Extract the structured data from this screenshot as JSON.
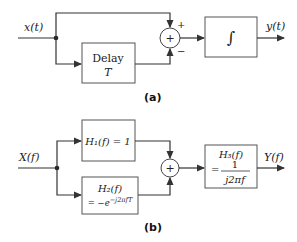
{
  "diagram_a": {
    "caption": "(a)",
    "input_label": "x(t)",
    "output_label": "y(t)",
    "delay_box": {
      "line1": "Delay",
      "line2": "T"
    },
    "summer": {
      "symbol": "+",
      "top_sign": "+",
      "bottom_sign": "−"
    },
    "integrator_symbol": "∫"
  },
  "diagram_b": {
    "caption": "(b)",
    "input_label": "X(f)",
    "output_label": "Y(f)",
    "h1_box": {
      "text": "H₁(f) = 1"
    },
    "h2_box": {
      "line1": "H₂(f)",
      "line2": "= −e⁻ʲ²ᵖᶠᵀ"
    },
    "summer": {
      "symbol": "+"
    },
    "h3_box": {
      "line1": "H₃(f)",
      "eq": "=",
      "numerator": "1",
      "denominator": "j2πf"
    }
  }
}
